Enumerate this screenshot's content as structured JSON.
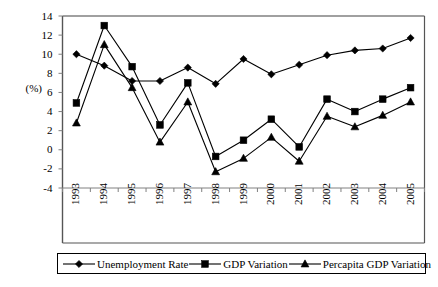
{
  "chart_data": {
    "type": "line",
    "title": "",
    "xlabel": "",
    "ylabel": "(%)",
    "categories": [
      "1993",
      "1994",
      "1995",
      "1996",
      "1997",
      "1998",
      "1999",
      "2000",
      "2001",
      "2002",
      "2003",
      "2004",
      "2005"
    ],
    "ylim": [
      -4,
      14
    ],
    "yticks": [
      "14",
      "12",
      "10",
      "8",
      "6",
      "4",
      "2",
      "0",
      "-2",
      "-4"
    ],
    "ytick_values": [
      14,
      12,
      10,
      8,
      6,
      4,
      2,
      0,
      -2,
      -4
    ],
    "grid": false,
    "legend_position": "bottom",
    "series": [
      {
        "name": "Unemployment Rate",
        "marker": "diamond",
        "values": [
          10.0,
          8.8,
          7.2,
          7.2,
          8.6,
          6.9,
          9.5,
          7.9,
          8.9,
          9.9,
          10.4,
          10.6,
          11.7
        ]
      },
      {
        "name": "GDP Variation",
        "marker": "square",
        "values": [
          4.9,
          13.0,
          8.7,
          2.6,
          7.0,
          -0.7,
          1.0,
          3.2,
          0.3,
          5.3,
          4.0,
          5.3,
          6.5
        ]
      },
      {
        "name": "Percapita GDP  Variation",
        "marker": "triangle",
        "values": [
          2.8,
          11.0,
          6.5,
          0.8,
          5.0,
          -2.3,
          -0.9,
          1.3,
          -1.2,
          3.5,
          2.4,
          3.6,
          5.0
        ]
      }
    ]
  },
  "axis": {
    "unit_label": "(%)"
  },
  "colors": {
    "line": "#000000",
    "marker": "#000000",
    "axis": "#808080",
    "frame": "#000000",
    "background": "#ffffff"
  }
}
